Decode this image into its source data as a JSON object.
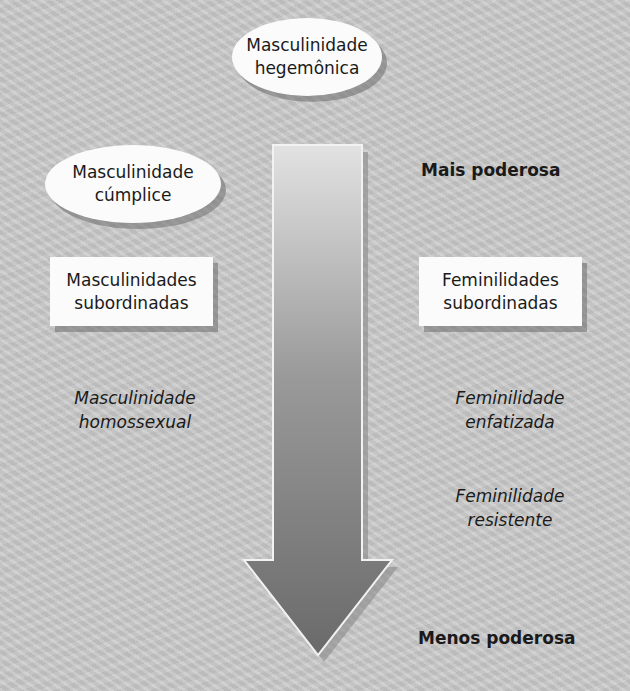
{
  "diagram": {
    "hegemonic": {
      "line1": "Masculinidade",
      "line2": "hegemônica"
    },
    "complicit": {
      "line1": "Masculinidade",
      "line2": "cúmplice"
    },
    "subordinate_masc": {
      "line1": "Masculinidades",
      "line2": "subordinadas"
    },
    "homosexual_masc": {
      "line1": "Masculinidade",
      "line2": "homossexual"
    },
    "subordinate_fem": {
      "line1": "Feminilidades",
      "line2": "subordinadas"
    },
    "emphasized_fem": {
      "line1": "Feminilidade",
      "line2": "enfatizada"
    },
    "resistant_fem": {
      "line1": "Feminilidade",
      "line2": "resistente"
    },
    "scale": {
      "top": "Mais poderosa",
      "bottom": "Menos poderosa"
    },
    "arrow": {
      "icon": "down-arrow-gradient",
      "color_top": "#e4e4e4",
      "color_bottom": "#6a6a6a"
    }
  }
}
